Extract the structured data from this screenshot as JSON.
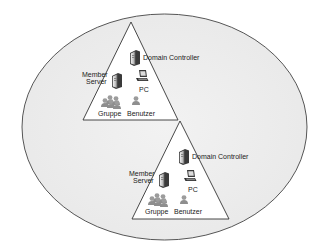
{
  "diagram": {
    "type": "active-directory-forest",
    "colors": {
      "forest_fill": "#eeeeee",
      "forest_stroke": "#444444",
      "domain_fill": "#ffffff",
      "domain_stroke": "#333333",
      "icon_dark": "#3a3a3a",
      "icon_light": "#cfcfcf",
      "people": "#9a9a9a"
    },
    "forest": {
      "shape": "ellipse",
      "cx": 164.5,
      "cy": 127,
      "rx": 142.5,
      "ry": 113
    },
    "domains": [
      {
        "id": "domain-1",
        "triangle": [
          [
            131,
            22
          ],
          [
            83,
            120
          ],
          [
            178,
            120
          ]
        ],
        "labels": {
          "domain_controller": "Domain Controller",
          "member_server_line1": "Member",
          "member_server_line2": "Server",
          "pc": "PC",
          "group": "Gruppe",
          "user": "Benutzer"
        }
      },
      {
        "id": "domain-2",
        "triangle": [
          [
            180,
            121
          ],
          [
            132,
            219
          ],
          [
            229,
            219
          ]
        ],
        "labels": {
          "domain_controller": "Domain Controller",
          "member_server_line1": "Member",
          "member_server_line2": "Server",
          "pc": "PC",
          "group": "Gruppe",
          "user": "Benutzer"
        }
      }
    ]
  }
}
